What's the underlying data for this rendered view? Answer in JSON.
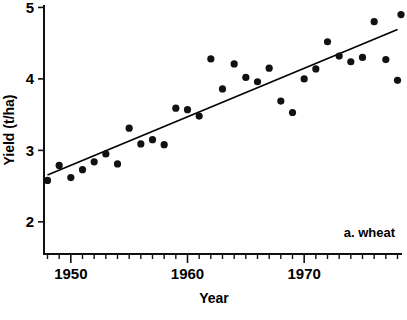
{
  "chart_data": {
    "type": "scatter",
    "title": "",
    "xlabel": "Year",
    "ylabel": "Yield  (t/ha)",
    "annotation": "a. wheat",
    "grid": false,
    "legend": "none",
    "xlim": [
      1947.7,
      1978.3
    ],
    "ylim": [
      1.55,
      5.02
    ],
    "x_tick_labels": [
      "1950",
      "1960",
      "1970"
    ],
    "x_major_ticks": [
      1950,
      1960,
      1970
    ],
    "x_minor_ticks": [
      1948,
      1949,
      1951,
      1952,
      1953,
      1954,
      1955,
      1956,
      1957,
      1958,
      1959,
      1961,
      1962,
      1963,
      1964,
      1965,
      1966,
      1967,
      1968,
      1969,
      1971,
      1972,
      1973,
      1974,
      1975,
      1976,
      1977,
      1978
    ],
    "y_tick_labels": [
      "5",
      "4",
      "3",
      "2"
    ],
    "y_ticks": [
      5,
      4,
      3,
      2
    ],
    "x": [
      1948,
      1949,
      1950,
      1951,
      1952,
      1953,
      1954,
      1955,
      1956,
      1957,
      1958,
      1959,
      1960,
      1961,
      1962,
      1963,
      1964,
      1965,
      1966,
      1967,
      1968,
      1969,
      1970,
      1971,
      1972,
      1973,
      1974,
      1975,
      1976,
      1977,
      1978
    ],
    "values": [
      2.58,
      2.79,
      2.62,
      2.73,
      2.84,
      2.95,
      2.81,
      3.31,
      3.09,
      3.15,
      3.08,
      3.59,
      3.57,
      3.48,
      4.28,
      3.86,
      4.21,
      4.02,
      3.96,
      4.15,
      3.69,
      3.53,
      4.0,
      4.14,
      4.52,
      4.32,
      4.24,
      4.3,
      4.8,
      4.27,
      3.98
    ],
    "series": [
      {
        "name": "a. wheat",
        "x": [
          1948,
          1949,
          1950,
          1951,
          1952,
          1953,
          1954,
          1955,
          1956,
          1957,
          1958,
          1959,
          1960,
          1961,
          1962,
          1963,
          1964,
          1965,
          1966,
          1967,
          1968,
          1969,
          1970,
          1971,
          1972,
          1973,
          1974,
          1975,
          1976,
          1977,
          1978
        ],
        "values": [
          2.58,
          2.79,
          2.62,
          2.73,
          2.84,
          2.95,
          2.81,
          3.31,
          3.09,
          3.15,
          3.08,
          3.59,
          3.57,
          3.48,
          4.28,
          3.86,
          4.21,
          4.02,
          3.96,
          4.15,
          3.69,
          3.53,
          4.0,
          4.14,
          4.52,
          4.32,
          4.24,
          4.3,
          4.8,
          4.27,
          3.98
        ]
      }
    ],
    "trend_line": {
      "type": "linear-fit",
      "x_start": 1948,
      "y_start": 2.655,
      "x_end": 1978,
      "y_end": 4.69
    },
    "marker": {
      "shape": "filled-circle",
      "radius_px": 3.6,
      "color": "#111111"
    },
    "last_point_x": 1978.3,
    "last_point_y": 4.9
  },
  "colors": {
    "axis": "#111111",
    "marker": "#111111",
    "trend": "#000000",
    "background": "#ffffff"
  }
}
